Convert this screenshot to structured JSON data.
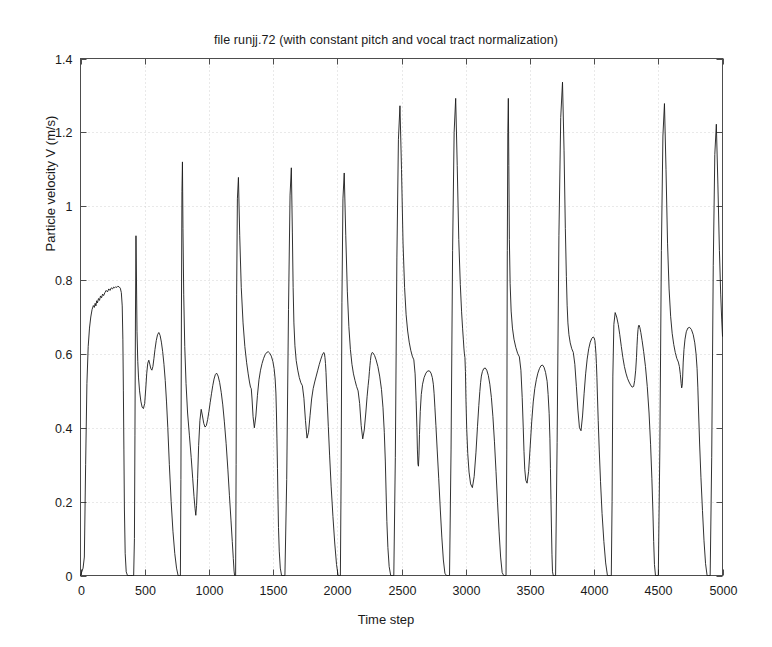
{
  "chart_data": {
    "type": "line",
    "title": "file runjj.72 (with constant pitch and vocal tract normalization)",
    "xlabel": "Time step",
    "ylabel": "Particle velocity V (m/s)",
    "xlim": [
      0,
      5000
    ],
    "ylim": [
      0,
      1.4
    ],
    "xticks": [
      0,
      500,
      1000,
      1500,
      2000,
      2500,
      3000,
      3500,
      4000,
      4500,
      5000
    ],
    "xtick_labels": [
      "0",
      "500",
      "1000",
      "1500",
      "2000",
      "2500",
      "3000",
      "3500",
      "4000",
      "4500",
      "5000"
    ],
    "yticks": [
      0,
      0.2,
      0.4,
      0.6,
      0.8,
      1,
      1.2,
      1.4
    ],
    "ytick_labels": [
      "0",
      "0.2",
      "0.4",
      "0.6",
      "0.8",
      "1",
      "1.2",
      "1.4"
    ],
    "grid": true,
    "grid_style": "dotted",
    "grid_color": "#c8c8c8",
    "line_color": "#1a1a1a",
    "line_width": 0.9,
    "background": "#ffffff",
    "legend": null,
    "series_name": "Particle velocity V",
    "x": [
      0,
      20,
      30,
      40,
      50,
      60,
      70,
      80,
      90,
      100,
      108,
      114,
      120,
      126,
      132,
      140,
      148,
      156,
      164,
      172,
      180,
      190,
      200,
      210,
      220,
      230,
      240,
      250,
      258,
      266,
      274,
      282,
      290,
      300,
      310,
      318,
      325,
      330,
      334,
      338,
      342,
      348,
      356,
      366,
      378,
      392,
      404,
      414,
      420,
      424,
      428,
      432,
      436,
      440,
      446,
      452,
      460,
      470,
      480,
      490,
      500,
      508,
      516,
      524,
      532,
      540,
      548,
      556,
      564,
      572,
      580,
      590,
      600,
      610,
      620,
      630,
      640,
      650,
      660,
      670,
      680,
      692,
      706,
      720,
      734,
      748,
      760,
      770,
      778,
      782,
      786,
      790,
      794,
      798,
      804,
      812,
      822,
      834,
      848,
      862,
      874,
      884,
      892,
      898,
      904,
      912,
      920,
      930,
      940,
      950,
      960,
      970,
      980,
      990,
      1000,
      1010,
      1020,
      1030,
      1040,
      1050,
      1060,
      1072,
      1084,
      1096,
      1108,
      1120,
      1134,
      1148,
      1160,
      1172,
      1182,
      1190,
      1196,
      1200,
      1204,
      1208,
      1212,
      1216,
      1222,
      1230,
      1240,
      1252,
      1266,
      1280,
      1294,
      1306,
      1316,
      1324,
      1330,
      1336,
      1344,
      1354,
      1366,
      1378,
      1390,
      1402,
      1414,
      1426,
      1438,
      1450,
      1462,
      1474,
      1486,
      1498,
      1508,
      1516,
      1522,
      1526,
      1530,
      1534,
      1538,
      1542,
      1548,
      1556,
      1566,
      1578,
      1592,
      1606,
      1620,
      1632,
      1642,
      1650,
      1656,
      1662,
      1670,
      1680,
      1692,
      1704,
      1716,
      1728,
      1740,
      1752,
      1764,
      1776,
      1788,
      1800,
      1812,
      1824,
      1836,
      1848,
      1860,
      1872,
      1882,
      1890,
      1896,
      1900,
      1904,
      1908,
      1912,
      1916,
      1922,
      1930,
      1940,
      1952,
      1966,
      1980,
      1994,
      2006,
      2016,
      2024,
      2030,
      2036,
      2044,
      2054,
      2066,
      2078,
      2090,
      2102,
      2114,
      2126,
      2138,
      2150,
      2162,
      2174,
      2186,
      2198,
      2210,
      2222,
      2232,
      2240,
      2246,
      2250,
      2254,
      2258,
      2262,
      2266,
      2272,
      2280,
      2290,
      2302,
      2316,
      2330,
      2344,
      2356,
      2366,
      2374,
      2380,
      2386,
      2394,
      2404,
      2416,
      2428,
      2440,
      2452,
      2464,
      2476,
      2488,
      2500,
      2512,
      2524,
      2536,
      2548,
      2560,
      2572,
      2584,
      2596,
      2606,
      2614,
      2620,
      2624,
      2628,
      2632,
      2636,
      2640,
      2646,
      2654,
      2664,
      2676,
      2690,
      2704,
      2718,
      2730,
      2740,
      2748,
      2754,
      2760,
      2768,
      2778,
      2790,
      2802,
      2814,
      2826,
      2838,
      2850,
      2862,
      2874,
      2886,
      2898,
      2910,
      2922,
      2934,
      2946,
      2958,
      2968,
      2976,
      2982,
      2986,
      2990,
      2994,
      2998,
      3002,
      3008,
      3016,
      3026,
      3038,
      3052,
      3066,
      3080,
      3092,
      3102,
      3110,
      3116,
      3122,
      3130,
      3140,
      3152,
      3164,
      3176,
      3188,
      3200,
      3212,
      3224,
      3236,
      3248,
      3260,
      3272,
      3284,
      3296,
      3306,
      3314,
      3320,
      3324,
      3328,
      3332,
      3336,
      3340,
      3346,
      3354,
      3364,
      3376,
      3390,
      3404,
      3418,
      3430,
      3440,
      3448,
      3454,
      3460,
      3468,
      3478,
      3490,
      3502,
      3514,
      3526,
      3538,
      3550,
      3562,
      3574,
      3586,
      3598,
      3610,
      3622,
      3634,
      3642,
      3650,
      3656,
      3660,
      3664,
      3668,
      3672,
      3676,
      3682,
      3690,
      3700,
      3712,
      3726,
      3740,
      3754,
      3766,
      3776,
      3784,
      3790,
      3796,
      3804,
      3814,
      3826,
      3838,
      3850,
      3862,
      3874,
      3886,
      3898,
      3910,
      3922,
      3934,
      3946,
      3958,
      3970,
      3982,
      3992,
      4000,
      4006,
      4010,
      4014,
      4018,
      4022,
      4026,
      4032,
      4040,
      4050,
      4062,
      4076,
      4090,
      4104,
      4116,
      4126,
      4134,
      4140,
      4146,
      4154,
      4164,
      4176,
      4188,
      4200,
      4212,
      4224,
      4236,
      4248,
      4260,
      4272,
      4284,
      4296,
      4308,
      4316,
      4324,
      4330,
      4334,
      4338,
      4342,
      4346,
      4350,
      4356,
      4364,
      4374,
      4386,
      4400,
      4414,
      4428,
      4440,
      4450,
      4458,
      4464,
      4470,
      4478,
      4488,
      4500,
      4512,
      4524,
      4536,
      4548,
      4560,
      4572,
      4584,
      4596,
      4608,
      4620,
      4632,
      4644,
      4656,
      4664,
      4672,
      4678,
      4682,
      4686,
      4690,
      4694,
      4700,
      4708,
      4718,
      4730,
      4744,
      4758,
      4772,
      4784,
      4794,
      4802,
      4808,
      4814,
      4822,
      4832,
      4844,
      4856,
      4868,
      4880,
      4892,
      4904,
      4916,
      4928,
      4940,
      4952,
      4964,
      4976,
      4986,
      4994,
      5000
    ],
    "y": [
      0.0,
      0.02,
      0.05,
      0.3,
      0.52,
      0.62,
      0.67,
      0.7,
      0.72,
      0.731,
      0.726,
      0.737,
      0.73,
      0.744,
      0.738,
      0.75,
      0.745,
      0.757,
      0.752,
      0.762,
      0.758,
      0.766,
      0.772,
      0.768,
      0.776,
      0.772,
      0.779,
      0.776,
      0.781,
      0.779,
      0.782,
      0.78,
      0.783,
      0.782,
      0.778,
      0.766,
      0.73,
      0.64,
      0.5,
      0.34,
      0.18,
      0.06,
      0.01,
      0.0,
      0.0,
      0.0,
      0.0,
      0.0,
      0.1,
      0.38,
      0.7,
      0.92,
      0.8,
      0.66,
      0.58,
      0.535,
      0.5,
      0.472,
      0.456,
      0.452,
      0.466,
      0.505,
      0.548,
      0.575,
      0.583,
      0.572,
      0.56,
      0.556,
      0.566,
      0.588,
      0.612,
      0.636,
      0.652,
      0.658,
      0.65,
      0.632,
      0.606,
      0.572,
      0.528,
      0.47,
      0.4,
      0.3,
      0.2,
      0.12,
      0.06,
      0.02,
      0.0,
      0.0,
      0.0,
      0.26,
      0.7,
      1.04,
      1.12,
      0.94,
      0.76,
      0.62,
      0.52,
      0.44,
      0.38,
      0.32,
      0.262,
      0.214,
      0.182,
      0.163,
      0.19,
      0.262,
      0.352,
      0.42,
      0.45,
      0.432,
      0.412,
      0.402,
      0.406,
      0.422,
      0.444,
      0.468,
      0.492,
      0.514,
      0.532,
      0.544,
      0.548,
      0.54,
      0.522,
      0.496,
      0.462,
      0.418,
      0.358,
      0.286,
      0.216,
      0.15,
      0.092,
      0.046,
      0.012,
      0.0,
      0.0,
      0.0,
      0.3,
      0.76,
      1.02,
      1.078,
      0.92,
      0.78,
      0.684,
      0.62,
      0.576,
      0.546,
      0.524,
      0.51,
      0.506,
      0.478,
      0.43,
      0.4,
      0.432,
      0.488,
      0.53,
      0.556,
      0.574,
      0.588,
      0.598,
      0.604,
      0.606,
      0.602,
      0.594,
      0.58,
      0.56,
      0.532,
      0.494,
      0.44,
      0.37,
      0.29,
      0.206,
      0.13,
      0.066,
      0.02,
      0.0,
      0.0,
      0.0,
      0.26,
      0.72,
      1.03,
      1.104,
      0.93,
      0.78,
      0.684,
      0.622,
      0.582,
      0.556,
      0.536,
      0.522,
      0.514,
      0.48,
      0.42,
      0.372,
      0.388,
      0.434,
      0.478,
      0.506,
      0.524,
      0.54,
      0.556,
      0.572,
      0.586,
      0.596,
      0.602,
      0.604,
      0.6,
      0.59,
      0.574,
      0.55,
      0.516,
      0.468,
      0.404,
      0.326,
      0.242,
      0.16,
      0.088,
      0.03,
      0.0,
      0.0,
      0.0,
      0.28,
      0.74,
      1.02,
      1.09,
      0.92,
      0.77,
      0.674,
      0.612,
      0.572,
      0.546,
      0.528,
      0.512,
      0.5,
      0.466,
      0.406,
      0.37,
      0.394,
      0.44,
      0.484,
      0.514,
      0.534,
      0.552,
      0.568,
      0.582,
      0.594,
      0.6,
      0.604,
      0.602,
      0.596,
      0.584,
      0.566,
      0.54,
      0.504,
      0.454,
      0.388,
      0.31,
      0.226,
      0.146,
      0.076,
      0.024,
      0.0,
      0.0,
      0.0,
      0.32,
      0.86,
      1.18,
      1.272,
      1.1,
      0.9,
      0.78,
      0.706,
      0.662,
      0.632,
      0.61,
      0.594,
      0.584,
      0.546,
      0.474,
      0.4,
      0.34,
      0.302,
      0.296,
      0.326,
      0.382,
      0.444,
      0.49,
      0.518,
      0.536,
      0.548,
      0.554,
      0.554,
      0.548,
      0.536,
      0.518,
      0.492,
      0.456,
      0.406,
      0.34,
      0.262,
      0.18,
      0.104,
      0.042,
      0.006,
      0.0,
      0.0,
      0.0,
      0.34,
      0.88,
      1.2,
      1.292,
      1.11,
      0.91,
      0.788,
      0.714,
      0.668,
      0.638,
      0.616,
      0.6,
      0.59,
      0.552,
      0.476,
      0.396,
      0.33,
      0.28,
      0.248,
      0.238,
      0.268,
      0.334,
      0.404,
      0.46,
      0.498,
      0.522,
      0.54,
      0.552,
      0.56,
      0.562,
      0.556,
      0.542,
      0.518,
      0.482,
      0.43,
      0.362,
      0.282,
      0.198,
      0.118,
      0.05,
      0.008,
      0.0,
      0.0,
      0.0,
      0.34,
      0.88,
      1.2,
      1.292,
      1.11,
      0.91,
      0.79,
      0.716,
      0.67,
      0.64,
      0.618,
      0.602,
      0.592,
      0.556,
      0.482,
      0.402,
      0.336,
      0.288,
      0.258,
      0.25,
      0.282,
      0.348,
      0.416,
      0.47,
      0.506,
      0.53,
      0.548,
      0.56,
      0.568,
      0.57,
      0.564,
      0.55,
      0.526,
      0.49,
      0.438,
      0.37,
      0.29,
      0.206,
      0.126,
      0.056,
      0.01,
      0.0,
      0.0,
      0.0,
      0.36,
      0.92,
      1.24,
      1.336,
      1.15,
      0.94,
      0.81,
      0.732,
      0.684,
      0.652,
      0.63,
      0.614,
      0.604,
      0.572,
      0.512,
      0.448,
      0.4,
      0.392,
      0.432,
      0.492,
      0.546,
      0.586,
      0.614,
      0.632,
      0.642,
      0.646,
      0.644,
      0.636,
      0.622,
      0.602,
      0.574,
      0.536,
      0.486,
      0.42,
      0.34,
      0.254,
      0.168,
      0.092,
      0.034,
      0.0,
      0.0,
      0.0,
      0.0,
      0.2,
      0.54,
      0.68,
      0.712,
      0.7,
      0.68,
      0.652,
      0.62,
      0.59,
      0.566,
      0.548,
      0.534,
      0.524,
      0.516,
      0.51,
      0.512,
      0.528,
      0.556,
      0.59,
      0.622,
      0.648,
      0.666,
      0.676,
      0.678,
      0.672,
      0.658,
      0.636,
      0.606,
      0.566,
      0.512,
      0.44,
      0.354,
      0.262,
      0.172,
      0.092,
      0.03,
      0.0,
      0.0,
      0.0,
      0.34,
      0.88,
      1.19,
      1.278,
      1.1,
      0.9,
      0.776,
      0.702,
      0.656,
      0.626,
      0.604,
      0.588,
      0.578,
      0.566,
      0.544,
      0.52,
      0.508,
      0.514,
      0.54,
      0.578,
      0.612,
      0.64,
      0.66,
      0.67,
      0.672,
      0.666,
      0.652,
      0.63,
      0.6,
      0.56,
      0.508,
      0.44,
      0.356,
      0.266,
      0.176,
      0.094,
      0.032,
      0.0,
      0.0,
      0.0,
      0.32,
      0.84,
      1.14,
      1.222,
      1.06,
      0.88,
      0.762,
      0.692,
      0.648,
      0.62,
      0.6,
      0.586,
      0.578,
      0.57,
      0.556,
      0.542,
      0.538,
      0.552,
      0.582,
      0.616,
      0.646,
      0.668,
      0.682,
      0.688,
      0.686,
      0.676,
      0.658,
      0.632,
      0.598,
      0.554,
      0.498,
      0.428,
      0.346,
      0.258,
      0.17,
      0.09,
      0.028,
      0.0,
      0.0,
      0.0,
      0.3,
      0.82,
      1.1,
      1.184,
      1.02,
      0.85,
      0.736,
      0.668,
      0.624,
      0.596,
      0.576,
      0.562,
      0.554,
      0.548,
      0.534,
      0.52,
      0.514,
      0.526,
      0.556,
      0.594,
      0.628,
      0.656,
      0.676,
      0.688,
      0.692,
      0.686,
      0.672,
      0.648,
      0.616,
      0.574,
      0.518,
      0.448,
      0.364,
      0.272,
      0.18,
      0.096,
      0.032,
      0.0,
      0.0,
      0.0,
      0.26,
      0.7,
      0.95,
      1.014,
      0.88,
      0.74,
      0.652,
      0.596,
      0.56,
      0.536,
      0.52,
      0.51,
      0.504,
      0.5,
      0.494,
      0.486,
      0.482,
      0.492,
      0.518,
      0.554,
      0.592,
      0.628,
      0.658,
      0.682,
      0.7,
      0.71,
      0.712,
      0.706,
      0.692,
      0.67,
      0.638,
      0.594,
      0.538,
      0.468,
      0.384,
      0.292,
      0.196,
      0.108,
      0.04,
      0.0,
      0.0,
      0.82
    ]
  }
}
